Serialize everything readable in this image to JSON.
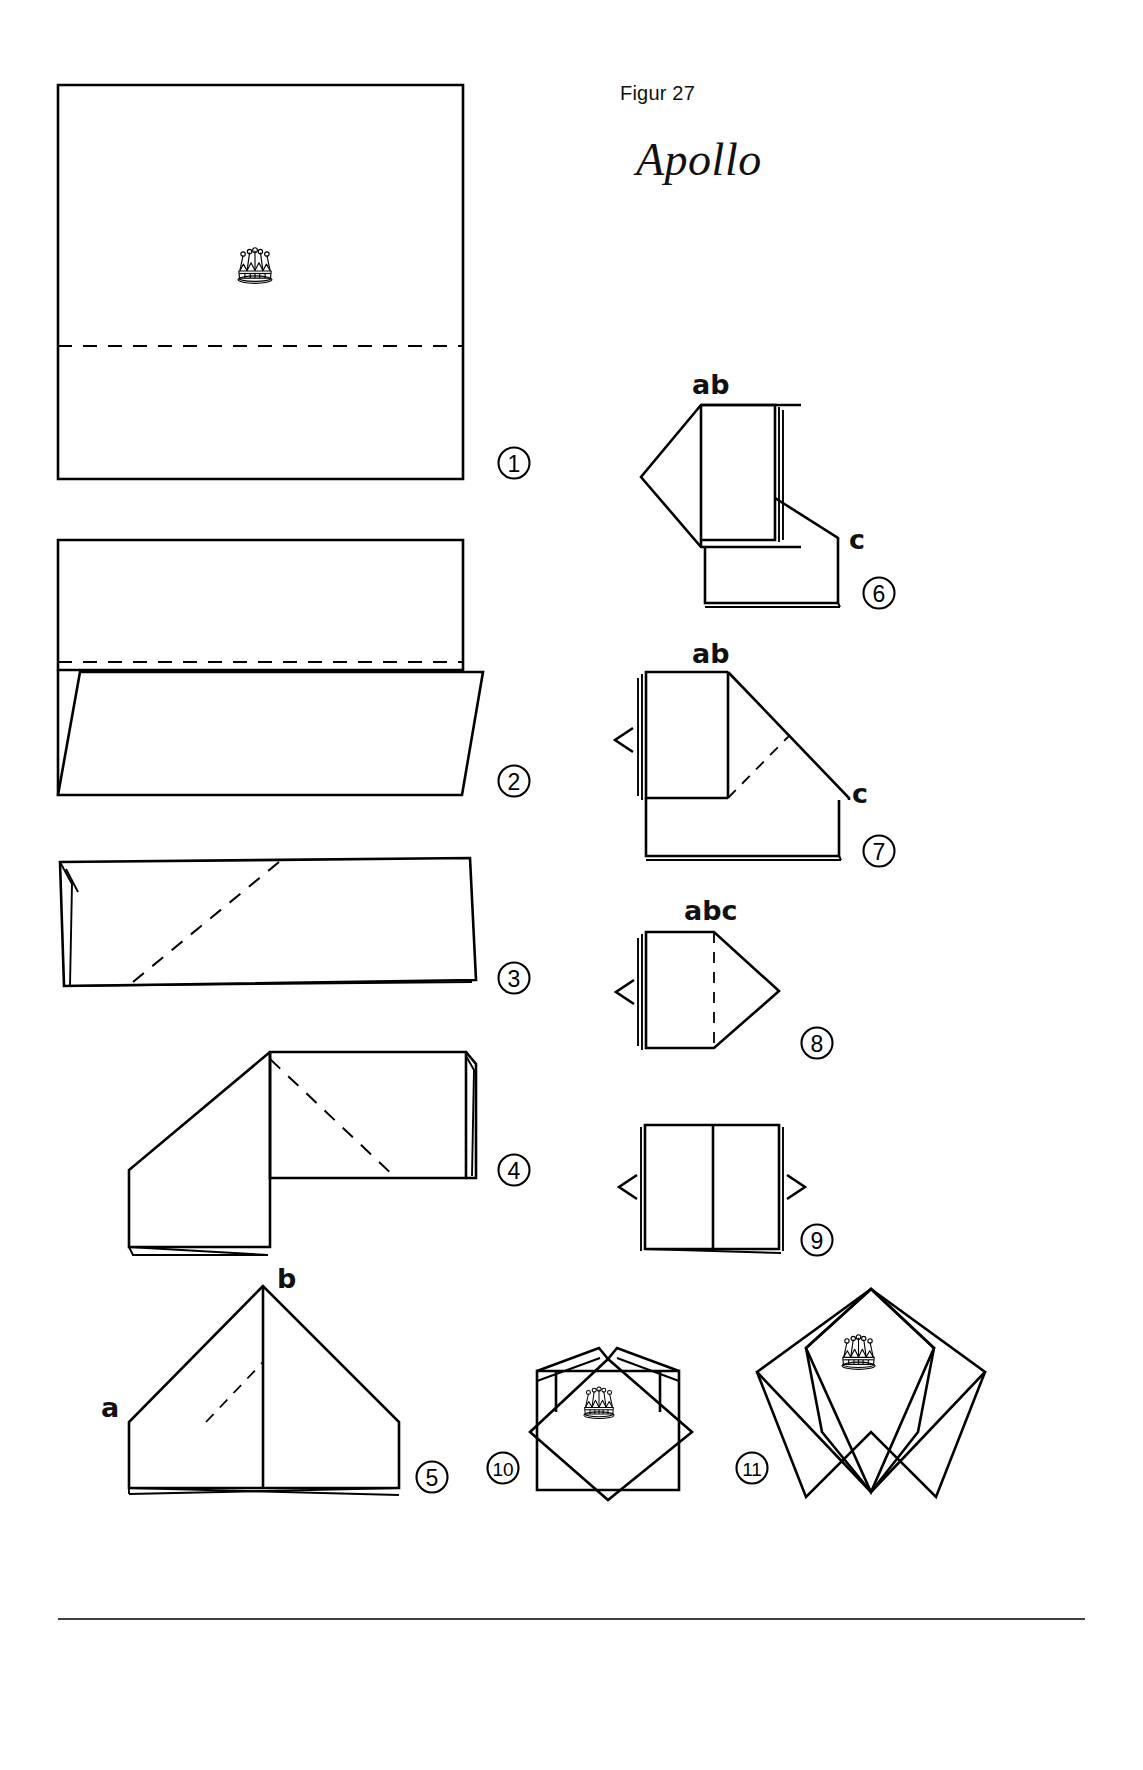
{
  "page": {
    "figure_label": "Figur 27",
    "title": "Apollo",
    "background": "#ffffff",
    "ink": "#000000"
  },
  "steps": [
    {
      "n": "1",
      "label": "1"
    },
    {
      "n": "2",
      "label": "2"
    },
    {
      "n": "3",
      "label": "3"
    },
    {
      "n": "4",
      "label": "4"
    },
    {
      "n": "5",
      "label": "5"
    },
    {
      "n": "6",
      "label": "6"
    },
    {
      "n": "7",
      "label": "7"
    },
    {
      "n": "8",
      "label": "8"
    },
    {
      "n": "9",
      "label": "9"
    },
    {
      "n": "10",
      "label": "10"
    },
    {
      "n": "11",
      "label": "11"
    }
  ],
  "point_labels": {
    "step5_b": "b",
    "step5_a": "a",
    "step6_ab": "ab",
    "step6_c": "c",
    "step7_ab": "ab",
    "step7_c": "c",
    "step8_abc": "abc"
  },
  "icons": {
    "crown": "crown-icon",
    "fold_dashed": "dashed-fold-line",
    "arrow_tuck": "tuck-arrow-icon"
  }
}
